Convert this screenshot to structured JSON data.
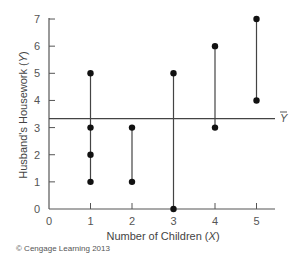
{
  "chart_data": {
    "type": "scatter",
    "title": "",
    "xlabel": "Number of Children (X)",
    "ylabel": "Husband's Housework (Y)",
    "xlim": [
      0,
      5.6
    ],
    "ylim": [
      0,
      7.2
    ],
    "x_ticks": [
      0,
      1,
      2,
      3,
      4,
      5
    ],
    "y_ticks": [
      0,
      1,
      2,
      3,
      4,
      5,
      6,
      7
    ],
    "grid": false,
    "points": [
      {
        "x": 1,
        "y": 1
      },
      {
        "x": 1,
        "y": 2
      },
      {
        "x": 1,
        "y": 3
      },
      {
        "x": 1,
        "y": 5
      },
      {
        "x": 2,
        "y": 1
      },
      {
        "x": 2,
        "y": 3
      },
      {
        "x": 3,
        "y": 0
      },
      {
        "x": 3,
        "y": 5
      },
      {
        "x": 4,
        "y": 3
      },
      {
        "x": 4,
        "y": 6
      },
      {
        "x": 5,
        "y": 4
      },
      {
        "x": 5,
        "y": 7
      }
    ],
    "vertical_ranges": [
      {
        "x": 1,
        "min": 1,
        "max": 5
      },
      {
        "x": 2,
        "min": 1,
        "max": 3
      },
      {
        "x": 3,
        "min": 0,
        "max": 5
      },
      {
        "x": 4,
        "min": 3,
        "max": 6
      },
      {
        "x": 5,
        "min": 4,
        "max": 7
      }
    ],
    "reference_line": {
      "label": "Ȳ",
      "y": 3.33,
      "orientation": "horizontal"
    },
    "legend": null
  },
  "labels": {
    "x_axis": "Number of Children (",
    "x_var": "X",
    "x_close": ")",
    "y_axis": "Husband's Housework (",
    "y_var": "Y",
    "y_close": ")",
    "mean_label": "Y",
    "copyright": "© Cengage Learning 2013"
  },
  "colors": {
    "axis": "#555555",
    "line": "#444444",
    "point": "#111111"
  }
}
